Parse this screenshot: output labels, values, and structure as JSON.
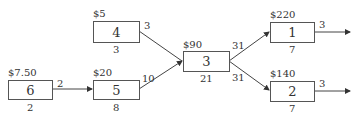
{
  "diagram": {
    "type": "network",
    "nodes": [
      {
        "id": "6",
        "label": "6",
        "cost": "$7.50",
        "right_value": "2",
        "bottom_value": "2"
      },
      {
        "id": "5",
        "label": "5",
        "cost": "$20",
        "right_value": "10",
        "bottom_value": "8"
      },
      {
        "id": "4",
        "label": "4",
        "cost": "$5",
        "right_value": "3",
        "bottom_value": "3"
      },
      {
        "id": "3",
        "label": "3",
        "cost": "$90",
        "right_value_top": "31",
        "right_value_bottom": "31",
        "bottom_value": "21"
      },
      {
        "id": "1",
        "label": "1",
        "cost": "$220",
        "right_value": "3",
        "bottom_value": "7"
      },
      {
        "id": "2",
        "label": "2",
        "cost": "$140",
        "right_value": "3",
        "bottom_value": "7"
      }
    ],
    "edges": [
      {
        "from": "6",
        "to": "5"
      },
      {
        "from": "4",
        "to": "3"
      },
      {
        "from": "5",
        "to": "3"
      },
      {
        "from": "3",
        "to": "1"
      },
      {
        "from": "3",
        "to": "2"
      },
      {
        "from": "1",
        "to": "out"
      },
      {
        "from": "2",
        "to": "out"
      }
    ]
  }
}
